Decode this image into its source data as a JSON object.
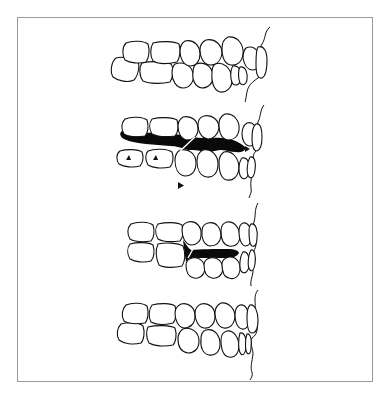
{
  "figure": {
    "type": "line-drawing",
    "panel_count": 4,
    "colors": {
      "background": "#ffffff",
      "frame_border": "#9a9a9a",
      "outline": "#111111",
      "space_fill": "#0a0a0a"
    },
    "panels": [
      {
        "id": "panel-1",
        "description": "teeth in normal occlusion",
        "has_black_space": false,
        "arrowheads": 0
      },
      {
        "id": "panel-2",
        "description": "open interocclusal space shown in black with arrowheads",
        "has_black_space": true,
        "arrowheads": 4
      },
      {
        "id": "panel-3",
        "description": "partial closure, small black space in anterior region",
        "has_black_space": true,
        "arrowheads": 0
      },
      {
        "id": "panel-4",
        "description": "teeth in full occlusion",
        "has_black_space": false,
        "arrowheads": 0
      }
    ]
  }
}
